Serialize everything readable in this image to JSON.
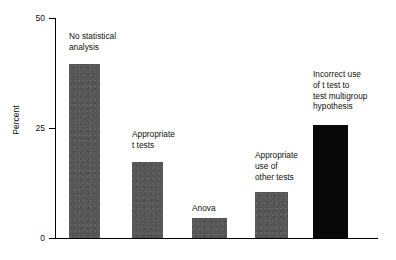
{
  "chart_data": {
    "type": "bar",
    "title": "",
    "xlabel": "",
    "ylabel": "Percent",
    "ylim": [
      0,
      50
    ],
    "yticks": [
      0,
      25,
      50
    ],
    "ytick_labels": [
      "0",
      "25",
      "50"
    ],
    "grid": false,
    "legend": "none",
    "categories": [
      "No statistical analysis",
      "Appropriate t tests",
      "Anova",
      "Appropriate use of other tests",
      "Incorrect use of t test to test multigroup hypothesis"
    ],
    "values": [
      39.5,
      17.3,
      4.5,
      10.5,
      25.7
    ],
    "bar_colors": [
      "#565656",
      "#565656",
      "#565656",
      "#565656",
      "#080808"
    ],
    "annotations": [
      {
        "text": "No statistical\nanalysis",
        "for": "No statistical analysis"
      },
      {
        "text": "Appropriate\nt tests",
        "for": "Appropriate t tests"
      },
      {
        "text": "Anova",
        "for": "Anova"
      },
      {
        "text": "Appropriate\nuse of\nother tests",
        "for": "Appropriate use of other tests"
      },
      {
        "text": "Incorrect use\nof t test to\ntest multigroup\nhypothesis",
        "for": "Incorrect use of t test to test multigroup hypothesis"
      }
    ]
  },
  "axis": {
    "y_title": "Percent",
    "y_tick_top": "50",
    "y_tick_mid": "25",
    "y_tick_bottom": "0"
  },
  "bars": [
    {
      "label": "No statistical\nanalysis",
      "value": 39.5
    },
    {
      "label": "Appropriate\nt tests",
      "value": 17.3
    },
    {
      "label": "Anova",
      "value": 4.5
    },
    {
      "label": "Appropriate\nuse of\nother tests",
      "value": 10.5
    },
    {
      "label": "Incorrect use\nof t test to\ntest multigroup\nhypothesis",
      "value": 25.7
    }
  ]
}
